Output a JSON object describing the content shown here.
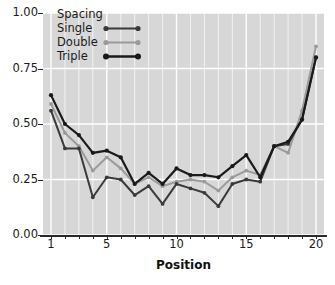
{
  "chart_data": {
    "type": "line",
    "title": "",
    "xlabel": "Position",
    "ylabel": "",
    "xlim": [
      1,
      20
    ],
    "ylim": [
      0.0,
      1.0
    ],
    "grid": true,
    "legend_position": "top-left",
    "legend_title": "Spacing",
    "x": [
      1,
      2,
      3,
      4,
      5,
      6,
      7,
      8,
      9,
      10,
      11,
      12,
      13,
      14,
      15,
      16,
      17,
      18,
      19,
      20
    ],
    "xticks": [
      1,
      5,
      10,
      15,
      20
    ],
    "xtick_labels": [
      "1",
      "5",
      "10",
      "15",
      "20"
    ],
    "yticks": [
      0.0,
      0.25,
      0.5,
      0.75,
      1.0
    ],
    "ytick_labels": [
      "0.00",
      "0.25",
      "0.50",
      "0.75",
      "1.00"
    ],
    "series": [
      {
        "name": "Single",
        "color": "#3a3a3a",
        "values": [
          0.56,
          0.39,
          0.39,
          0.17,
          0.26,
          0.25,
          0.18,
          0.22,
          0.14,
          0.23,
          0.21,
          0.19,
          0.13,
          0.23,
          0.25,
          0.24,
          0.4,
          0.41,
          0.52,
          0.8
        ]
      },
      {
        "name": "Double",
        "color": "#9a9a9a",
        "values": [
          0.59,
          0.46,
          0.4,
          0.29,
          0.35,
          0.3,
          0.23,
          0.26,
          0.22,
          0.24,
          0.25,
          0.24,
          0.2,
          0.26,
          0.29,
          0.27,
          0.4,
          0.37,
          0.56,
          0.85
        ]
      },
      {
        "name": "Triple",
        "color": "#1a1a1a",
        "values": [
          0.63,
          0.5,
          0.45,
          0.37,
          0.38,
          0.35,
          0.23,
          0.28,
          0.23,
          0.3,
          0.27,
          0.27,
          0.26,
          0.31,
          0.36,
          0.26,
          0.4,
          0.42,
          0.52,
          0.8
        ]
      }
    ],
    "styling": {
      "plot_background": "#d7d7d7",
      "gridline_color": "#ffffff",
      "page_background": "#ffffff",
      "axis_color": "#2a2a2a",
      "marker": "circle"
    }
  }
}
